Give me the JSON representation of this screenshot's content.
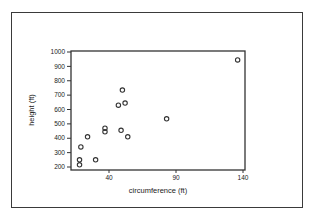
{
  "chart_data": {
    "type": "scatter",
    "title": "",
    "xlabel": "circumference (ft)",
    "ylabel": "height (ft)",
    "xlim": [
      11.6,
      141
    ],
    "ylim": [
      190,
      1000
    ],
    "xticks": [
      40,
      90,
      140
    ],
    "yticks": [
      200,
      300,
      400,
      500,
      600,
      700,
      800,
      900,
      1000
    ],
    "grid": false,
    "legend": null,
    "marker": "open-circle",
    "points": [
      {
        "x": 18,
        "y": 250
      },
      {
        "x": 18,
        "y": 215
      },
      {
        "x": 19,
        "y": 340
      },
      {
        "x": 24,
        "y": 410
      },
      {
        "x": 30,
        "y": 250
      },
      {
        "x": 37,
        "y": 470
      },
      {
        "x": 37,
        "y": 445
      },
      {
        "x": 47,
        "y": 630
      },
      {
        "x": 50,
        "y": 735
      },
      {
        "x": 52,
        "y": 645
      },
      {
        "x": 49,
        "y": 455
      },
      {
        "x": 54,
        "y": 410
      },
      {
        "x": 83,
        "y": 535
      },
      {
        "x": 136,
        "y": 945
      }
    ]
  },
  "labels": {
    "xlabel": "circumference (ft)",
    "ylabel": "height (ft)",
    "xticks": [
      "40",
      "90",
      "140"
    ],
    "yticks": [
      "200",
      "300",
      "400",
      "500",
      "600",
      "700",
      "800",
      "900",
      "1000"
    ]
  },
  "colors": {
    "axis": "#333333",
    "marker": "#333333",
    "text": "#222222",
    "frame": "#3a3a3a"
  }
}
